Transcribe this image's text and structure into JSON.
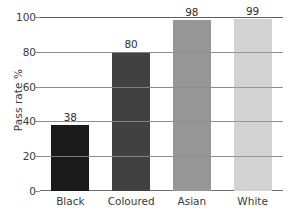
{
  "chart_data": {
    "type": "bar",
    "title": "",
    "subtitle": "",
    "xlabel": "",
    "ylabel": "Pass rate %",
    "categories": [
      "Black",
      "Coloured",
      "Asian",
      "White"
    ],
    "values": [
      38,
      80,
      98,
      99
    ],
    "value_labels": [
      "38",
      "80",
      "98",
      "99"
    ],
    "bar_colors": [
      "#1a1a1a",
      "#414141",
      "#969696",
      "#d2d2d2"
    ],
    "ylim": [
      0,
      100
    ],
    "yticks": [
      0,
      20,
      40,
      60,
      80,
      100
    ],
    "ytick_labels": [
      "0",
      "20",
      "40",
      "60",
      "80",
      "100"
    ],
    "grid": true,
    "grid_axis": "y",
    "grid_color": "#8c8c8c",
    "legend": false,
    "legend_position": "none",
    "background_color": "#ffffff",
    "text_color": "#3b3b3b",
    "series": [
      {
        "name": "Pass rate %",
        "values": [
          38,
          80,
          98,
          99
        ]
      }
    ]
  }
}
